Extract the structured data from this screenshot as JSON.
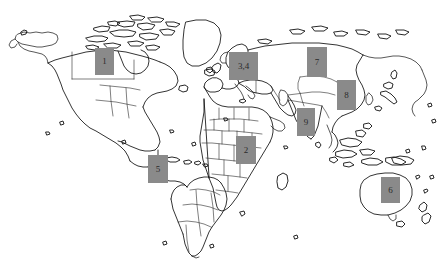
{
  "figure": {
    "kind": "world-map",
    "background_color": "#ffffff",
    "outline_color": "#111111",
    "width": 438,
    "height": 261,
    "title": "",
    "caption": "",
    "legend": "",
    "marker_color": "#8a8a8a",
    "marker_text_color": "#2b2b2b"
  },
  "markers": [
    {
      "id": "marker-1",
      "label": "1",
      "region": "north-america",
      "left": 95,
      "top": 48,
      "width": 19,
      "height": 27
    },
    {
      "id": "marker-3-4",
      "label": "3,4",
      "region": "eastern-europe",
      "left": 229,
      "top": 52,
      "width": 29,
      "height": 28
    },
    {
      "id": "marker-7",
      "label": "7",
      "region": "central-asia",
      "left": 307,
      "top": 47,
      "width": 20,
      "height": 30
    },
    {
      "id": "marker-8",
      "label": "8",
      "region": "east-asia",
      "left": 337,
      "top": 80,
      "width": 19,
      "height": 30
    },
    {
      "id": "marker-9",
      "label": "9",
      "region": "south-asia",
      "left": 297,
      "top": 108,
      "width": 18,
      "height": 28
    },
    {
      "id": "marker-2",
      "label": "2",
      "region": "central-africa",
      "left": 236,
      "top": 136,
      "width": 20,
      "height": 28
    },
    {
      "id": "marker-5",
      "label": "5",
      "region": "south-america",
      "left": 148,
      "top": 155,
      "width": 20,
      "height": 28
    },
    {
      "id": "marker-6",
      "label": "6",
      "region": "australia",
      "left": 381,
      "top": 177,
      "width": 19,
      "height": 26
    }
  ]
}
